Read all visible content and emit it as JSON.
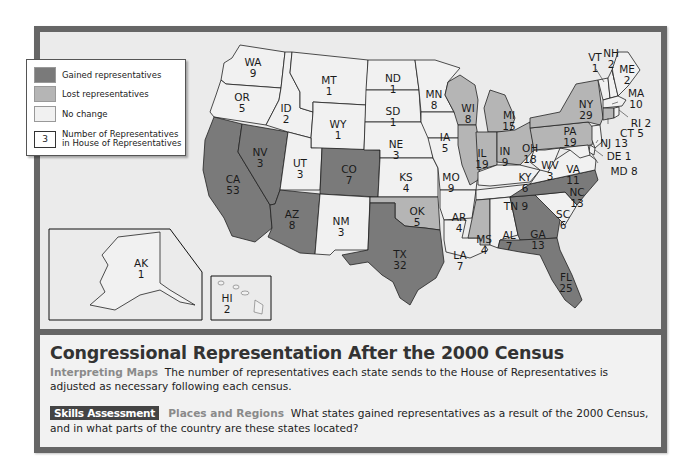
{
  "map": {
    "colors": {
      "gained": "#7a7a7a",
      "lost": "#b5b5b5",
      "no_change": "#f1f1f1",
      "water": "#ebebeb",
      "frame": "#666666"
    },
    "legend": {
      "items": [
        {
          "key": "gained",
          "label": "Gained representatives"
        },
        {
          "key": "lost",
          "label": "Lost representatives"
        },
        {
          "key": "no_change",
          "label": "No change"
        }
      ],
      "number_sample": "3",
      "number_label_line1": "Number of Representatives",
      "number_label_line2": "in House of Representatives"
    },
    "states": [
      {
        "abbr": "WA",
        "reps": 9,
        "status": "no_change"
      },
      {
        "abbr": "OR",
        "reps": 5,
        "status": "no_change"
      },
      {
        "abbr": "CA",
        "reps": 53,
        "status": "gained"
      },
      {
        "abbr": "NV",
        "reps": 3,
        "status": "gained"
      },
      {
        "abbr": "ID",
        "reps": 2,
        "status": "no_change"
      },
      {
        "abbr": "MT",
        "reps": 1,
        "status": "no_change"
      },
      {
        "abbr": "WY",
        "reps": 1,
        "status": "no_change"
      },
      {
        "abbr": "UT",
        "reps": 3,
        "status": "no_change"
      },
      {
        "abbr": "CO",
        "reps": 7,
        "status": "gained"
      },
      {
        "abbr": "AZ",
        "reps": 8,
        "status": "gained"
      },
      {
        "abbr": "NM",
        "reps": 3,
        "status": "no_change"
      },
      {
        "abbr": "ND",
        "reps": 1,
        "status": "no_change"
      },
      {
        "abbr": "SD",
        "reps": 1,
        "status": "no_change"
      },
      {
        "abbr": "NE",
        "reps": 3,
        "status": "no_change"
      },
      {
        "abbr": "KS",
        "reps": 4,
        "status": "no_change"
      },
      {
        "abbr": "OK",
        "reps": 5,
        "status": "lost"
      },
      {
        "abbr": "TX",
        "reps": 32,
        "status": "gained"
      },
      {
        "abbr": "MN",
        "reps": 8,
        "status": "no_change"
      },
      {
        "abbr": "IA",
        "reps": 5,
        "status": "no_change"
      },
      {
        "abbr": "MO",
        "reps": 9,
        "status": "no_change"
      },
      {
        "abbr": "AR",
        "reps": 4,
        "status": "no_change"
      },
      {
        "abbr": "LA",
        "reps": 7,
        "status": "no_change"
      },
      {
        "abbr": "WI",
        "reps": 8,
        "status": "lost"
      },
      {
        "abbr": "IL",
        "reps": 19,
        "status": "lost"
      },
      {
        "abbr": "MI",
        "reps": 15,
        "status": "lost"
      },
      {
        "abbr": "IN",
        "reps": 9,
        "status": "lost"
      },
      {
        "abbr": "OH",
        "reps": 18,
        "status": "lost"
      },
      {
        "abbr": "KY",
        "reps": 6,
        "status": "no_change"
      },
      {
        "abbr": "TN",
        "reps": 9,
        "status": "no_change"
      },
      {
        "abbr": "MS",
        "reps": 4,
        "status": "lost"
      },
      {
        "abbr": "AL",
        "reps": 7,
        "status": "no_change"
      },
      {
        "abbr": "GA",
        "reps": 13,
        "status": "gained"
      },
      {
        "abbr": "FL",
        "reps": 25,
        "status": "gained"
      },
      {
        "abbr": "SC",
        "reps": 6,
        "status": "no_change"
      },
      {
        "abbr": "NC",
        "reps": 13,
        "status": "gained"
      },
      {
        "abbr": "VA",
        "reps": 11,
        "status": "no_change"
      },
      {
        "abbr": "WV",
        "reps": 3,
        "status": "no_change"
      },
      {
        "abbr": "PA",
        "reps": 19,
        "status": "lost"
      },
      {
        "abbr": "NY",
        "reps": 29,
        "status": "lost"
      },
      {
        "abbr": "VT",
        "reps": 1,
        "status": "no_change"
      },
      {
        "abbr": "NH",
        "reps": 2,
        "status": "no_change"
      },
      {
        "abbr": "ME",
        "reps": 2,
        "status": "no_change"
      },
      {
        "abbr": "MA",
        "reps": 10,
        "status": "no_change"
      },
      {
        "abbr": "RI",
        "reps": 2,
        "status": "no_change"
      },
      {
        "abbr": "CT",
        "reps": 5,
        "status": "lost"
      },
      {
        "abbr": "NJ",
        "reps": 13,
        "status": "no_change"
      },
      {
        "abbr": "DE",
        "reps": 1,
        "status": "no_change"
      },
      {
        "abbr": "MD",
        "reps": 8,
        "status": "no_change"
      },
      {
        "abbr": "AK",
        "reps": 1,
        "status": "no_change"
      },
      {
        "abbr": "HI",
        "reps": 2,
        "status": "no_change"
      }
    ],
    "labels": {
      "WA": "WA",
      "WA_n": "9",
      "OR": "OR",
      "OR_n": "5",
      "CA": "CA",
      "CA_n": "53",
      "NV": "NV",
      "NV_n": "3",
      "ID": "ID",
      "ID_n": "2",
      "MT": "MT",
      "MT_n": "1",
      "WY": "WY",
      "WY_n": "1",
      "UT": "UT",
      "UT_n": "3",
      "CO": "CO",
      "CO_n": "7",
      "AZ": "AZ",
      "AZ_n": "8",
      "NM": "NM",
      "NM_n": "3",
      "ND": "ND",
      "ND_n": "1",
      "SD": "SD",
      "SD_n": "1",
      "NE": "NE",
      "NE_n": "3",
      "KS": "KS",
      "KS_n": "4",
      "OK": "OK",
      "OK_n": "5",
      "TX": "TX",
      "TX_n": "32",
      "MN": "MN",
      "MN_n": "8",
      "IA": "IA",
      "IA_n": "5",
      "MO": "MO",
      "MO_n": "9",
      "AR": "AR",
      "AR_n": "4",
      "LA": "LA",
      "LA_n": "7",
      "WI": "WI",
      "WI_n": "8",
      "IL": "IL",
      "IL_n": "19",
      "MI": "MI",
      "MI_n": "15",
      "IN": "IN",
      "IN_n": "9",
      "OH": "OH",
      "OH_n": "18",
      "KY": "KY",
      "KY_n": "6",
      "TN": "TN 9",
      "MS": "MS",
      "MS_n": "4",
      "AL": "AL",
      "AL_n": "7",
      "GA": "GA",
      "GA_n": "13",
      "FL": "FL",
      "FL_n": "25",
      "SC": "SC",
      "SC_n": "6",
      "NC": "NC",
      "NC_n": "13",
      "VA": "VA",
      "VA_n": "11",
      "WV": "WV",
      "WV_n": "3",
      "PA": "PA",
      "PA_n": "19",
      "NY": "NY",
      "NY_n": "29",
      "VT": "VT",
      "VT_n": "1",
      "NH": "NH",
      "NH_n": "2",
      "ME": "ME",
      "ME_n": "2",
      "MA": "MA",
      "MA_n": "10",
      "RI": "RI 2",
      "CT": "CT 5",
      "NJ": "NJ 13",
      "DE": "DE 1",
      "MD": "MD 8",
      "AK": "AK",
      "AK_n": "1",
      "HI": "HI",
      "HI_n": "2"
    }
  },
  "caption": {
    "title": "Congressional Representation After the 2000 Census",
    "interpreting_label": "Interpreting Maps",
    "interpreting_text": "The number of representatives each state sends to the House of Representatives is adjusted as necessary following each census.",
    "skills_badge": "Skills Assessment",
    "skills_label": "Places and Regions",
    "skills_text": "What states gained representatives as a result of the 2000 Census, and in what parts of the country are these states located?"
  }
}
